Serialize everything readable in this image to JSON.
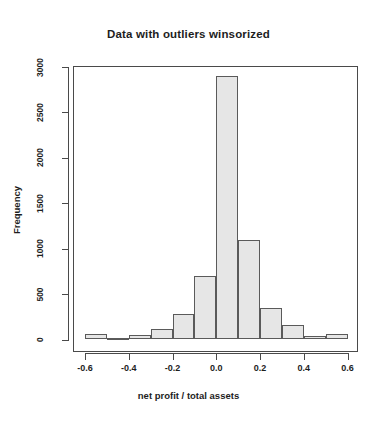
{
  "chart_data": {
    "type": "bar",
    "title": "Data with outliers winsorized",
    "xlabel": "net profit / total assets",
    "ylabel": "Frequency",
    "grid": false,
    "legend": "none",
    "xlim": [
      -0.6,
      0.6
    ],
    "ylim": [
      0,
      3000
    ],
    "bin_width": 0.1,
    "xticks": [
      -0.6,
      -0.4,
      -0.2,
      0.0,
      0.2,
      0.4,
      0.6
    ],
    "xtick_labels": [
      "-0.6",
      "-0.4",
      "-0.2",
      "0.0",
      "0.2",
      "0.4",
      "0.6"
    ],
    "yticks": [
      0,
      500,
      1000,
      1500,
      2000,
      2500,
      3000
    ],
    "ytick_labels": [
      "0",
      "500",
      "1000",
      "1500",
      "2000",
      "2500",
      "3000"
    ],
    "bar_fill_color": "#e6e6e6",
    "bar_edge_color": "#5a5a5a",
    "categories": [
      "-0.6 to -0.5",
      "-0.5 to -0.4",
      "-0.4 to -0.3",
      "-0.3 to -0.2",
      "-0.2 to -0.1",
      "-0.1 to 0.0",
      "0.0 to 0.1",
      "0.1 to 0.2",
      "0.2 to 0.3",
      "0.3 to 0.4",
      "0.4 to 0.5",
      "0.5 to 0.6"
    ],
    "bin_edges": [
      -0.6,
      -0.5,
      -0.4,
      -0.3,
      -0.2,
      -0.1,
      0.0,
      0.1,
      0.2,
      0.3,
      0.4,
      0.5,
      0.6
    ],
    "values": [
      60,
      20,
      50,
      120,
      280,
      700,
      2900,
      1100,
      350,
      160,
      40,
      60
    ]
  }
}
